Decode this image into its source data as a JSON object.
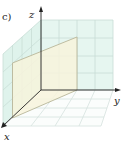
{
  "figure": {
    "panel_label": "c)",
    "axes": {
      "x": "x",
      "y": "y",
      "z": "z"
    },
    "colors": {
      "grid_line": "#c8ddd6",
      "wall_fill": "#e6f6f0",
      "plane_fill": "#f7f3dc",
      "plane_edge": "#b9b79a",
      "axis": "#222222"
    }
  }
}
